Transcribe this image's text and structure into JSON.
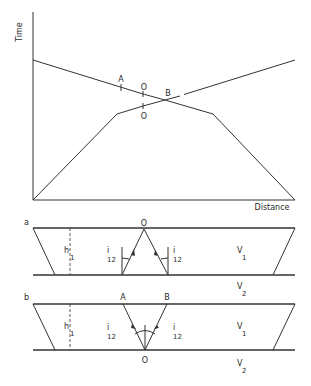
{
  "top_chart": {
    "y_axis_label": "Time",
    "x_axis_label": "Distance",
    "points": {
      "A": "A",
      "O_upper": "O",
      "O_lower": "O",
      "B": "B"
    }
  },
  "panel_a": {
    "label": "a",
    "point_O": "O",
    "h1": {
      "main": "h",
      "sub": "1"
    },
    "i12_left": {
      "main": "i",
      "sub": "12"
    },
    "i12_right": {
      "main": "i",
      "sub": "12"
    },
    "v1": {
      "main": "V",
      "sub": "1"
    },
    "v2": {
      "main": "V",
      "sub": "2"
    }
  },
  "panel_b": {
    "label": "b",
    "point_A": "A",
    "point_B": "B",
    "point_O": "O",
    "h1": {
      "main": "h",
      "sub": "1"
    },
    "i12_left": {
      "main": "i",
      "sub": "12"
    },
    "i12_right": {
      "main": "i",
      "sub": "12"
    },
    "v1": {
      "main": "V",
      "sub": "1"
    },
    "v2": {
      "main": "V",
      "sub": "2"
    }
  },
  "colors": {
    "line": "#333333",
    "text": "#2a2a2a",
    "background": "#ffffff"
  }
}
